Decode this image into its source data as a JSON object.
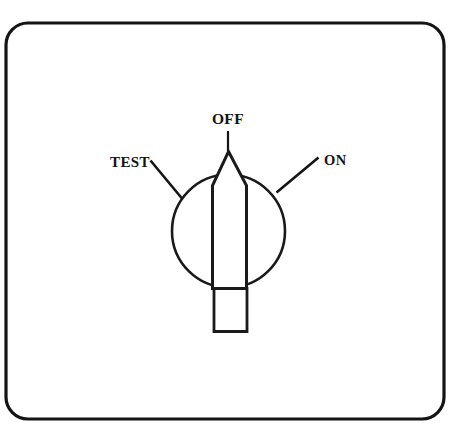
{
  "figure": {
    "background_color": "#ffffff",
    "ink_color": "#141414"
  },
  "panel": {
    "name": "panel-outline",
    "shape": "rounded-rectangle",
    "corner_radius": 22
  },
  "knob": {
    "name": "rotary-knob",
    "body_shape": "circle",
    "pointer_shape": "blade",
    "pointer_direction": "up",
    "selected_position": "OFF",
    "tab_shape": "rectangle"
  },
  "labels": [
    {
      "id": "test",
      "text": "TEST",
      "position": "left",
      "x": 110,
      "y": 167
    },
    {
      "id": "off",
      "text": "OFF",
      "position": "top",
      "x": 208,
      "y": 124
    },
    {
      "id": "on",
      "text": "ON",
      "position": "right",
      "x": 324,
      "y": 165
    }
  ],
  "leaders": [
    {
      "id": "test-leader",
      "from_label": "TEST",
      "to": "knob-left"
    },
    {
      "id": "off-leader",
      "from_label": "OFF",
      "to": "pointer-tip"
    },
    {
      "id": "on-leader",
      "from_label": "ON",
      "to": "knob-right"
    }
  ]
}
